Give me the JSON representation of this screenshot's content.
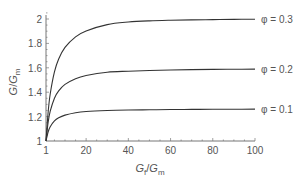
{
  "chart_data": {
    "type": "line",
    "title": "",
    "xlabel": "G_f/G_m",
    "ylabel": "G/G_m",
    "xlabel_parts": {
      "base1": "G",
      "sub1": "f",
      "sep": "/",
      "base2": "G",
      "sub2": "m"
    },
    "ylabel_parts": {
      "base1": "G",
      "sep": "/",
      "base2": "G",
      "sub2": "m"
    },
    "xlim": [
      1,
      100
    ],
    "ylim": [
      1,
      2
    ],
    "x_ticks": [
      1,
      20,
      40,
      60,
      80,
      100
    ],
    "y_ticks": [
      1,
      1.2,
      1.4,
      1.6,
      1.8,
      2
    ],
    "x_tick_labels": [
      "1",
      "20",
      "40",
      "60",
      "80",
      "100"
    ],
    "y_tick_labels": [
      "1",
      "1.2",
      "1.4",
      "1.6",
      "1.8",
      "2"
    ],
    "grid": false,
    "legend": "inline labels at right end of curves",
    "x": [
      1,
      2,
      3,
      5,
      7,
      10,
      15,
      20,
      30,
      40,
      50,
      60,
      70,
      80,
      90,
      100
    ],
    "series": [
      {
        "name": "φ = 0.3",
        "label": "φ = 0.3",
        "values": [
          1.0,
          1.234,
          1.385,
          1.566,
          1.672,
          1.767,
          1.854,
          1.902,
          1.954,
          1.975,
          1.985,
          1.99,
          1.993,
          1.995,
          1.997,
          1.998
        ]
      },
      {
        "name": "φ = 0.2",
        "label": "φ = 0.2",
        "values": [
          1.0,
          1.152,
          1.244,
          1.351,
          1.411,
          1.464,
          1.511,
          1.537,
          1.564,
          1.572,
          1.578,
          1.582,
          1.585,
          1.587,
          1.588,
          1.589
        ]
      },
      {
        "name": "φ = 0.1",
        "label": "φ = 0.1",
        "values": [
          1.0,
          1.074,
          1.116,
          1.164,
          1.19,
          1.212,
          1.232,
          1.242,
          1.25,
          1.254,
          1.256,
          1.258,
          1.259,
          1.26,
          1.26,
          1.261
        ]
      }
    ],
    "colors": {
      "line": "#333333",
      "axis": "#777777",
      "text": "#555555"
    }
  }
}
